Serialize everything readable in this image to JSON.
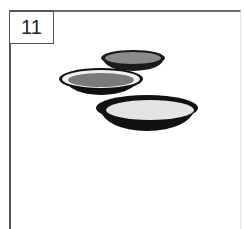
{
  "figure": {
    "number_label": "11",
    "items": [
      {
        "name": "back-plate",
        "rim": "#1a1a1a",
        "well": "#8a8a8a"
      },
      {
        "name": "middle-plate",
        "rim": "#111111",
        "inner_ring": "#f0f0f0",
        "well": "#7a7a7a"
      },
      {
        "name": "front-bowl",
        "rim": "#111111",
        "well": "#e4e4e4"
      }
    ]
  }
}
